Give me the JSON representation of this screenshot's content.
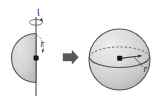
{
  "figure": {
    "background_color": "#ffffff",
    "stroke_color": "#4a4a4a",
    "fill_color": "#d2d2d2",
    "dot_color": "#111111",
    "left_panel": {
      "name": "half-disk-with-axis",
      "axis_label": "l",
      "radius_label": "r",
      "shape": "semicircle",
      "axis_orientation": "vertical",
      "rotation_indicator": "circular-arrow",
      "center_marker": "dot",
      "radius_guide": "dashed-arc"
    },
    "transform_arrow": {
      "name": "right-arrow",
      "glyph": "➡",
      "direction": "right"
    },
    "right_panel": {
      "name": "sphere-with-radius",
      "radius_label": "r",
      "shape": "sphere",
      "equator_front": "solid-ellipse-half",
      "equator_back": "dashed-ellipse-half",
      "center_marker": "dot",
      "radius_arrow": "center-to-surface"
    }
  }
}
